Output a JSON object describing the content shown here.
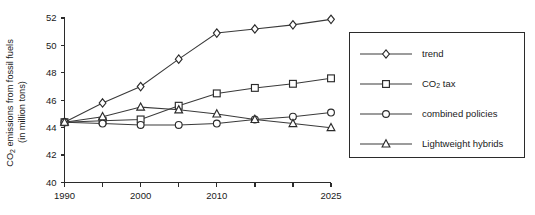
{
  "chart_data": {
    "type": "line",
    "title": "",
    "xlabel": "",
    "ylabel": "CO2 emissions from fossil fuels (in million tons)",
    "ylabel_line1": "CO",
    "ylabel_line1_sub": "2",
    "ylabel_line1_rest": " emissions from fossil fuels",
    "ylabel_line2": "(in million tons)",
    "x": [
      1990,
      1995,
      2000,
      2005,
      2010,
      2015,
      2020,
      2025
    ],
    "xtick_labels": [
      "1990",
      "",
      "2000",
      "",
      "2010",
      "",
      "",
      "2025"
    ],
    "xtick_labels_all": [
      "1990",
      "1995",
      "2000",
      "2005",
      "2010",
      "2015",
      "2020",
      "2025"
    ],
    "yticks": [
      40,
      42,
      44,
      46,
      48,
      50,
      52
    ],
    "ytick_labels": [
      "40",
      "42",
      "44",
      "46",
      "48",
      "50",
      "52"
    ],
    "xlim": [
      1990,
      2025
    ],
    "ylim": [
      40,
      52
    ],
    "grid": false,
    "legend_position": "right-outside",
    "series": [
      {
        "name": "trend",
        "marker": "diamond",
        "values": [
          44.4,
          45.8,
          47.0,
          49.0,
          50.9,
          51.2,
          51.5,
          51.9
        ]
      },
      {
        "name": "CO2 tax",
        "name_prefix": "CO",
        "name_sub": "2",
        "name_suffix": " tax",
        "marker": "square",
        "values": [
          44.4,
          44.5,
          44.6,
          45.6,
          46.5,
          46.9,
          47.2,
          47.6
        ]
      },
      {
        "name": "combined policies",
        "marker": "circle",
        "values": [
          44.4,
          44.3,
          44.2,
          44.2,
          44.3,
          44.6,
          44.8,
          45.1
        ]
      },
      {
        "name": "Lightweight hybrids",
        "marker": "triangle",
        "values": [
          44.4,
          44.8,
          45.5,
          45.3,
          45.0,
          44.6,
          44.3,
          44.0
        ]
      }
    ]
  },
  "legend": {
    "items": [
      {
        "label": "trend",
        "marker": "diamond"
      },
      {
        "label": "CO2 tax",
        "marker": "square"
      },
      {
        "label": "combined policies",
        "marker": "circle"
      },
      {
        "label": "Lightweight hybrids",
        "marker": "triangle"
      }
    ]
  }
}
